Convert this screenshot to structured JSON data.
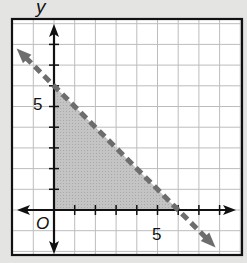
{
  "chart_data": {
    "type": "area",
    "title": "",
    "xlabel": "",
    "ylabel": "y",
    "origin_label": "O",
    "tick_labels": {
      "x": [
        "5"
      ],
      "y": [
        "5"
      ]
    },
    "xlim": [
      -2,
      9
    ],
    "ylim": [
      -2,
      9
    ],
    "grid": true,
    "legend": null,
    "boundary_line": {
      "equation": "x + y = 6",
      "style": "dashed",
      "points": [
        [
          -2,
          8
        ],
        [
          8,
          -2
        ]
      ],
      "arrowheads": "both"
    },
    "shaded_region": {
      "inequalities": [
        "x >= 0",
        "y >= 0",
        "x + y < 6"
      ],
      "vertices": [
        [
          0,
          0
        ],
        [
          0,
          6
        ],
        [
          6,
          0
        ]
      ]
    },
    "colors": {
      "background": "#e4e4e2",
      "grid": "#bdbdbd",
      "shade": "#bdbdbd",
      "dashed_line": "#6d6d6d",
      "axes": "#111111"
    }
  },
  "labels": {
    "y_axis": "y",
    "origin": "O",
    "x_tick_5": "5",
    "y_tick_5": "5"
  }
}
